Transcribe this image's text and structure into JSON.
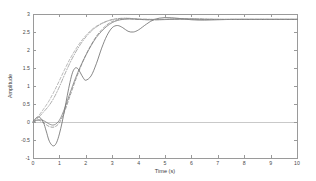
{
  "figure": {
    "background": "#ffffff",
    "axis_color": "#9a9a9a",
    "zero_line_color": "#c9c9c9"
  },
  "chart_data": {
    "type": "line",
    "title": "",
    "xlabel": "Time (s)",
    "ylabel": "Amplitude",
    "xlim": [
      0,
      10
    ],
    "ylim": [
      -1,
      3
    ],
    "xticks": [
      0,
      1,
      2,
      3,
      4,
      5,
      6,
      7,
      8,
      9,
      10
    ],
    "xtick_labels": [
      "0",
      "1",
      "2",
      "3",
      "4",
      "5",
      "6",
      "7",
      "8",
      "9",
      "10"
    ],
    "yticks": [
      -1,
      -0.5,
      0,
      0.5,
      1,
      1.5,
      2,
      2.5,
      3
    ],
    "ytick_labels": [
      "-1",
      "-0.5",
      "0",
      "0.5",
      "1",
      "1.5",
      "2",
      "2.5",
      "3"
    ],
    "grid": false,
    "legend": null,
    "zero_reference_line": 0,
    "steady_state_value": 2.85,
    "series": [
      {
        "name": "response-1",
        "style": "solid",
        "color": "#555555",
        "x": [
          0,
          0.1,
          0.2,
          0.3,
          0.4,
          0.5,
          0.6,
          0.7,
          0.8,
          0.9,
          1.0,
          1.1,
          1.2,
          1.3,
          1.4,
          1.5,
          1.6,
          1.7,
          1.8,
          1.9,
          2.0,
          2.2,
          2.4,
          2.6,
          2.8,
          3.0,
          3.2,
          3.4,
          3.6,
          3.8,
          4.0,
          4.3,
          4.6,
          5.0,
          5.5,
          6.0,
          6.5,
          7.0,
          7.5,
          8.0,
          8.5,
          9.0,
          9.5,
          10.0
        ],
        "values": [
          0.0,
          0.1,
          0.14,
          0.1,
          -0.02,
          -0.25,
          -0.5,
          -0.63,
          -0.66,
          -0.56,
          -0.33,
          -0.02,
          0.35,
          0.74,
          1.1,
          1.38,
          1.5,
          1.48,
          1.36,
          1.23,
          1.16,
          1.28,
          1.62,
          2.05,
          2.4,
          2.62,
          2.68,
          2.62,
          2.52,
          2.5,
          2.56,
          2.72,
          2.85,
          2.9,
          2.88,
          2.84,
          2.83,
          2.84,
          2.85,
          2.85,
          2.85,
          2.85,
          2.85,
          2.85
        ]
      },
      {
        "name": "response-2",
        "style": "solid",
        "color": "#6b6b6b",
        "x": [
          0,
          0.2,
          0.4,
          0.6,
          0.8,
          1.0,
          1.2,
          1.4,
          1.6,
          1.8,
          2.0,
          2.2,
          2.4,
          2.6,
          2.8,
          3.0,
          3.2,
          3.4,
          3.6,
          3.8,
          4.0,
          4.4,
          4.8,
          5.2,
          5.6,
          6.0,
          6.5,
          7.0,
          7.5,
          8.0,
          9.0,
          10.0
        ],
        "values": [
          0.0,
          0.06,
          0.04,
          -0.05,
          -0.08,
          0.05,
          0.38,
          0.8,
          1.2,
          1.55,
          1.85,
          2.12,
          2.35,
          2.52,
          2.66,
          2.76,
          2.82,
          2.85,
          2.86,
          2.86,
          2.85,
          2.84,
          2.84,
          2.85,
          2.86,
          2.86,
          2.85,
          2.85,
          2.85,
          2.85,
          2.85,
          2.85
        ]
      },
      {
        "name": "response-3",
        "style": "dashed",
        "color": "#777777",
        "x": [
          0,
          0.2,
          0.4,
          0.6,
          0.8,
          1.0,
          1.2,
          1.4,
          1.6,
          1.8,
          2.0,
          2.2,
          2.4,
          2.6,
          2.8,
          3.0,
          3.2,
          3.4,
          3.6,
          3.8,
          4.0,
          4.5,
          5.0,
          5.5,
          6.0,
          7.0,
          8.0,
          9.0,
          10.0
        ],
        "values": [
          0.0,
          0.05,
          -0.02,
          -0.12,
          -0.14,
          -0.02,
          0.3,
          0.72,
          1.14,
          1.52,
          1.86,
          2.14,
          2.38,
          2.56,
          2.7,
          2.79,
          2.84,
          2.86,
          2.87,
          2.86,
          2.85,
          2.84,
          2.85,
          2.86,
          2.86,
          2.85,
          2.85,
          2.85,
          2.85
        ]
      },
      {
        "name": "response-4",
        "style": "dashdot",
        "color": "#8a8a8a",
        "x": [
          0,
          0.2,
          0.4,
          0.6,
          0.8,
          1.0,
          1.2,
          1.4,
          1.6,
          1.8,
          2.0,
          2.2,
          2.4,
          2.6,
          2.8,
          3.0,
          3.2,
          3.4,
          3.6,
          3.8,
          4.0,
          4.5,
          5.0,
          5.5,
          6.0,
          7.0,
          8.0,
          9.0,
          10.0
        ],
        "values": [
          0.0,
          0.12,
          0.28,
          0.45,
          0.68,
          0.98,
          1.32,
          1.64,
          1.92,
          2.16,
          2.36,
          2.52,
          2.64,
          2.73,
          2.8,
          2.84,
          2.87,
          2.88,
          2.88,
          2.87,
          2.86,
          2.85,
          2.85,
          2.86,
          2.86,
          2.85,
          2.85,
          2.85,
          2.85
        ]
      },
      {
        "name": "response-5",
        "style": "dashed",
        "color": "#999999",
        "x": [
          0,
          0.2,
          0.4,
          0.6,
          0.8,
          1.0,
          1.2,
          1.4,
          1.6,
          1.8,
          2.0,
          2.2,
          2.4,
          2.6,
          2.8,
          3.0,
          3.2,
          3.4,
          3.6,
          3.8,
          4.0,
          4.5,
          5.0,
          5.5,
          6.0,
          7.0,
          8.0,
          9.0,
          10.0
        ],
        "values": [
          0.0,
          0.16,
          0.36,
          0.58,
          0.85,
          1.15,
          1.46,
          1.75,
          2.0,
          2.22,
          2.4,
          2.55,
          2.66,
          2.74,
          2.8,
          2.85,
          2.87,
          2.88,
          2.88,
          2.87,
          2.86,
          2.85,
          2.85,
          2.86,
          2.86,
          2.85,
          2.85,
          2.85,
          2.85
        ]
      }
    ]
  }
}
